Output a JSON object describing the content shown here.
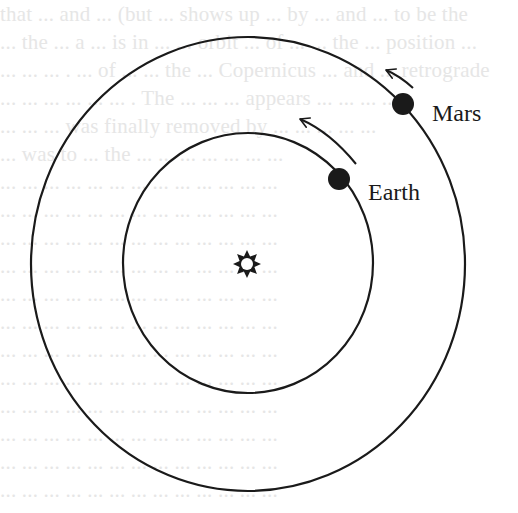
{
  "diagram": {
    "type": "orbital-diagram",
    "colors": {
      "background": "#ffffff",
      "ink": "#1a1a1a",
      "bleed_text": "#e6e6e6"
    },
    "sun": {
      "icon": "sun-star-icon",
      "label": ""
    },
    "orbits": [
      {
        "name": "earth-orbit"
      },
      {
        "name": "mars-orbit"
      }
    ],
    "planets": [
      {
        "label": "Earth",
        "direction": "counterclockwise"
      },
      {
        "label": "Mars",
        "direction": "counterclockwise"
      }
    ]
  },
  "background_bleed_text": [
    "that ... and ... (but ... shows up ... by ... and ... to be the",
    "... the ... a ... is in ... ... orbit ... of ... ... the ... position ...",
    "... ... ... . ... of ... ... the ... Copernicus ... and ... retrograde",
    "... ... ... ... ... ... . The ... ... ... appears ... ... ... ...",
    "... ... ... was finally removed by ... ... ... ... ...",
    "... was to ... the ... ... ... ... ... ... ...",
    "... ... ... ... ... ... ... ... ... ... ... ... ...",
    "... ... ... ... ... ... ... ... ... ... ... ... ...",
    "... ... ... ... ... ... ... ... ... ... ... ... ...",
    "... ... ... ... ... ... ... ... ... ... ... ... ...",
    "... ... ... ... ... ... ... ... ... ... ... ... ...",
    "... ... ... ... ... ... ... ... ... ... ... ... ...",
    "... ... ... ... ... ... ... ... ... ... ... ... ...",
    "... ... ... ... ... ... ... ... ... ... ... ... ...",
    "... ... ... ... ... ... ... ... ... ... ... ... ...",
    "... ... ... ... ... ... ... ... ... ... ... ... ...",
    "... ... ... ... ... ... ... ... ... ... ... ... ...",
    "... ... ... ... ... ... ... ... ... ... ... ... ..."
  ]
}
